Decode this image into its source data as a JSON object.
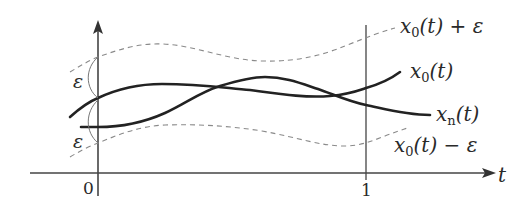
{
  "diagram": {
    "axes": {
      "x_label": "t",
      "tick_0": "0",
      "tick_1": "1"
    },
    "curves": {
      "upper_bound": {
        "label_main": "x",
        "label_sub": "0",
        "label_rest": "(t) + ε",
        "style": "dashed"
      },
      "center": {
        "label_main": "x",
        "label_sub": "0",
        "label_rest": "(t)",
        "style": "solid-thick"
      },
      "approx": {
        "label_main": "x",
        "label_sub": "n",
        "label_rest": "(t)",
        "style": "solid-thick"
      },
      "lower_bound": {
        "label_main": "x",
        "label_sub": "0",
        "label_rest": "(t) − ε",
        "style": "dashed"
      }
    },
    "epsilon_marks": {
      "upper": "ε",
      "lower": "ε"
    },
    "colors": {
      "curve": "#222222",
      "dashed": "#8a8a8a",
      "axis": "#444444",
      "background": "#ffffff"
    }
  }
}
